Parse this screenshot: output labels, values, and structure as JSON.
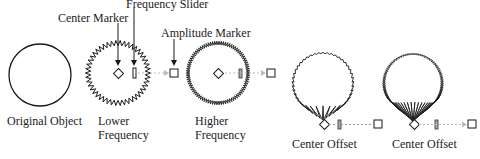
{
  "callouts": {
    "center_marker": "Center Marker",
    "frequency_slider": "Frequency Slider",
    "amplitude_marker": "Amplitude Marker"
  },
  "figures": [
    {
      "id": "original",
      "label_lines": [
        "Original Object"
      ]
    },
    {
      "id": "lower",
      "label_lines": [
        "Lower",
        "Frequency"
      ]
    },
    {
      "id": "higher",
      "label_lines": [
        "Higher",
        "Frequency"
      ]
    },
    {
      "id": "offset1",
      "label_lines": [
        "Center Offset"
      ]
    },
    {
      "id": "offset2",
      "label_lines": [
        "Center Offset"
      ]
    }
  ],
  "colors": {
    "stroke": "#1a1a1a",
    "dotted_line": "#bbbbbb",
    "background": "#ffffff"
  }
}
